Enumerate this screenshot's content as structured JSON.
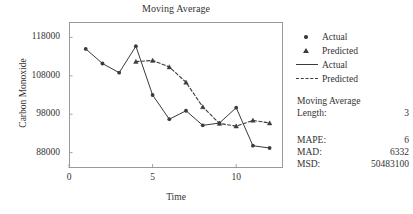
{
  "chart_data": {
    "type": "line",
    "title": "Moving Average",
    "xlabel": "Time",
    "ylabel": "Carbon Monoxide",
    "xlim": [
      0,
      12.8
    ],
    "ylim": [
      84000,
      122000
    ],
    "xticks": [
      0,
      5,
      10
    ],
    "xtick_labels": [
      "0",
      "5",
      "10"
    ],
    "yticks": [
      88000,
      98000,
      108000,
      118000
    ],
    "ytick_labels": [
      "88000",
      "98000",
      "108000",
      "118000"
    ],
    "grid": false,
    "legend_position": "right",
    "series": [
      {
        "name": "Actual",
        "style": "solid",
        "marker": "circle",
        "x": [
          1,
          2,
          3,
          4,
          5,
          6,
          7,
          8,
          9,
          10,
          11,
          12
        ],
        "values": [
          115000,
          111200,
          108800,
          115700,
          103000,
          96700,
          98900,
          95100,
          95700,
          99700,
          89800,
          89200
        ]
      },
      {
        "name": "Predicted",
        "style": "dashed",
        "marker": "triangle",
        "x": [
          4,
          5,
          6,
          7,
          8,
          9,
          10,
          11,
          12
        ],
        "values": [
          111700,
          112000,
          110300,
          106300,
          99900,
          95600,
          94900,
          96400,
          95700
        ]
      }
    ]
  },
  "legend": {
    "entries": [
      {
        "label": "Actual",
        "key": "marker-circle-icon"
      },
      {
        "label": "Predicted",
        "key": "marker-triangle-icon"
      },
      {
        "label": "Actual",
        "key": "line-solid-icon"
      },
      {
        "label": "Predicted",
        "key": "line-dashed-icon"
      }
    ]
  },
  "moving_average": {
    "heading": "Moving Average",
    "length_label": "Length:",
    "length_value": "3"
  },
  "accuracy": {
    "rows": [
      {
        "label": "MAPE:",
        "value": "6"
      },
      {
        "label": "MAD:",
        "value": "6332"
      },
      {
        "label": "MSD:",
        "value": "50483100"
      }
    ]
  },
  "colors": {
    "ink": "#3b3b3b",
    "frame": "#9a9a9a",
    "text": "#333333",
    "background": "#ffffff"
  }
}
